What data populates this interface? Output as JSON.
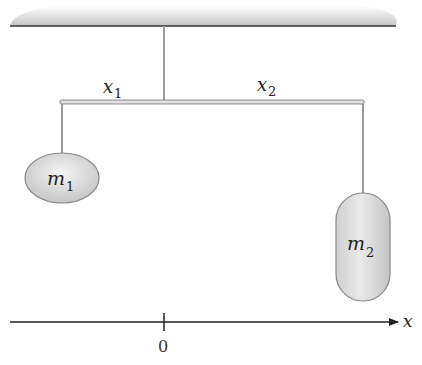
{
  "diagram": {
    "ceiling": {
      "color": "#c9c9c9",
      "line_color": "#333333"
    },
    "rod": {
      "color": "#d8d8d8",
      "stroke": "#777777"
    },
    "labels": {
      "x1": {
        "base": "x",
        "sub": "1"
      },
      "x2": {
        "base": "x",
        "sub": "2"
      },
      "m1": {
        "base": "m",
        "sub": "1"
      },
      "m2": {
        "base": "m",
        "sub": "2"
      }
    },
    "axis": {
      "label": "x",
      "origin_label": "0"
    },
    "mass_colors": {
      "fill_light": "#f2f2f2",
      "fill_dark": "#c4c4c4",
      "stroke": "#888888"
    }
  }
}
